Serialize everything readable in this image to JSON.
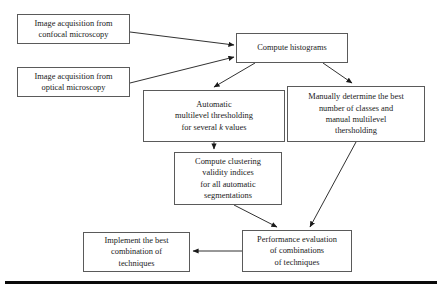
{
  "diagram": {
    "type": "flowchart",
    "title_visible": false,
    "background_color": "#ffffff",
    "box_border_color": "#5a5a5a",
    "box_fill_color": "#ffffff",
    "edge_color": "#1a1a1a",
    "rule_color": "#0a0a0a",
    "nodes": [
      {
        "id": "confocal",
        "name": "image-acquisition-confocal",
        "text": "Image acquisition from\nconfocal microscopy",
        "x": 17,
        "y": 14,
        "w": 113,
        "h": 30
      },
      {
        "id": "optical",
        "name": "image-acquisition-optical",
        "text": "Image acquisition from\noptical microscopy",
        "x": 17,
        "y": 67,
        "w": 113,
        "h": 30
      },
      {
        "id": "histograms",
        "name": "compute-histograms",
        "text": "Compute histograms",
        "x": 236,
        "y": 33,
        "w": 112,
        "h": 30
      },
      {
        "id": "automatic",
        "name": "automatic-multilevel-thresholding",
        "text_html": "Automatic\nmultilevel thresholding\nfor several <em>k</em> values",
        "text": "Automatic multilevel thresholding for several k values",
        "x": 143,
        "y": 90,
        "w": 142,
        "h": 52
      },
      {
        "id": "manual",
        "name": "manual-multilevel-thresholding",
        "text": "Manually determine the best\nnumber of classes and\nmanual multilevel\nthersholding",
        "x": 287,
        "y": 86,
        "w": 138,
        "h": 56
      },
      {
        "id": "clustering",
        "name": "compute-clustering-validity-indices",
        "text": "Compute clustering\nvalidity indices\nfor all automatic\nsegmentations",
        "x": 174,
        "y": 152,
        "w": 108,
        "h": 53
      },
      {
        "id": "performance",
        "name": "performance-evaluation",
        "text": "Performance evaluation\nof combinations\nof techniques",
        "x": 242,
        "y": 230,
        "w": 110,
        "h": 42
      },
      {
        "id": "implement",
        "name": "implement-best-combination",
        "text": "Implement the best\ncombination of\ntechniques",
        "x": 83,
        "y": 232,
        "w": 107,
        "h": 40
      }
    ],
    "edges": [
      {
        "name": "edge-confocal-to-histograms",
        "from": "confocal",
        "to": "histograms",
        "points": "130,32 234,45"
      },
      {
        "name": "edge-optical-to-histograms",
        "from": "optical",
        "to": "histograms",
        "points": "130,83 234,57"
      },
      {
        "name": "edge-histograms-to-automatic",
        "from": "histograms",
        "to": "automatic",
        "points": "255,63 214,87"
      },
      {
        "name": "edge-histograms-to-manual",
        "from": "histograms",
        "to": "manual",
        "points": "323,63 352,83"
      },
      {
        "name": "edge-automatic-to-clustering",
        "from": "automatic",
        "to": "clustering",
        "points": "214,142 214,149"
      },
      {
        "name": "edge-clustering-to-performance",
        "from": "clustering",
        "to": "performance",
        "points": "234,205 277,227"
      },
      {
        "name": "edge-manual-to-performance",
        "from": "manual",
        "to": "performance",
        "points": "356,142 310,227"
      },
      {
        "name": "edge-performance-to-implement",
        "from": "performance",
        "to": "implement",
        "points": "242,251 193,251"
      }
    ],
    "bottom_rule": {
      "name": "bottom-rule",
      "x": 5,
      "y": 281,
      "w": 432,
      "h": 3
    }
  }
}
